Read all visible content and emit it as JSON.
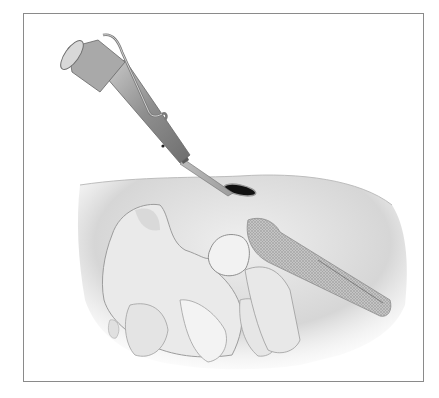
{
  "figure": {
    "type": "medical-illustration",
    "colors": {
      "background": "#ffffff",
      "frame_border": "#8a8a8a",
      "skin": "#d9d9d9",
      "bone": "#eeeeee",
      "instrument": "#9a9a9a",
      "incision": "#111111"
    }
  }
}
